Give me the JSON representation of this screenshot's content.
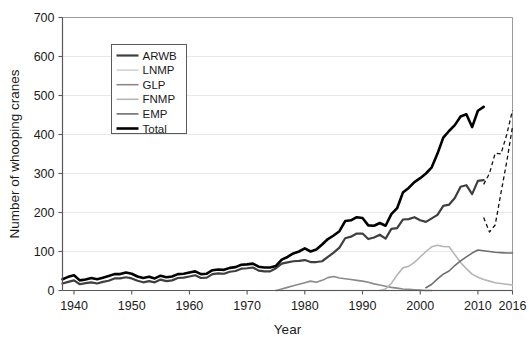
{
  "chart_data": {
    "type": "line",
    "title": "",
    "xlabel": "Year",
    "ylabel": "Number of whooping cranes",
    "xlim": [
      1938,
      2016
    ],
    "ylim": [
      0,
      700
    ],
    "xticks": [
      1940,
      1950,
      1960,
      1970,
      1980,
      1990,
      2000,
      2010,
      2016
    ],
    "yticks": [
      0,
      100,
      200,
      300,
      400,
      500,
      600,
      700
    ],
    "grid": "horizontal",
    "legend_position": "upper-left-inside",
    "legend_entries": [
      "ARWB",
      "LNMP",
      "GLP",
      "FNMP",
      "EMP",
      "Total"
    ],
    "colors": {
      "ARWB": "#3f3f3f",
      "LNMP": "#cfcfcf",
      "GLP": "#8a8a8a",
      "FNMP": "#b5b5b5",
      "EMP": "#6e6e6e",
      "Total": "#000000",
      "grid": "#e8e8e8",
      "frame": "#9a9a9a",
      "axis": "#595959"
    },
    "series": [
      {
        "name": "ARWB",
        "style": "solid",
        "x": [
          1938,
          1939,
          1940,
          1941,
          1942,
          1943,
          1944,
          1945,
          1946,
          1947,
          1948,
          1949,
          1950,
          1951,
          1952,
          1953,
          1954,
          1955,
          1956,
          1957,
          1958,
          1959,
          1960,
          1961,
          1962,
          1963,
          1964,
          1965,
          1966,
          1967,
          1968,
          1969,
          1970,
          1971,
          1972,
          1973,
          1974,
          1975,
          1976,
          1977,
          1978,
          1979,
          1980,
          1981,
          1982,
          1983,
          1984,
          1985,
          1986,
          1987,
          1988,
          1989,
          1990,
          1991,
          1992,
          1993,
          1994,
          1995,
          1996,
          1997,
          1998,
          1999,
          2000,
          2001,
          2002,
          2003,
          2004,
          2005,
          2006,
          2007,
          2008,
          2009,
          2010,
          2011,
          2012,
          2013,
          2014,
          2015,
          2016
        ],
        "values": [
          18,
          22,
          26,
          16,
          19,
          21,
          18,
          22,
          25,
          31,
          31,
          34,
          31,
          25,
          21,
          24,
          21,
          28,
          24,
          26,
          32,
          33,
          36,
          39,
          32,
          33,
          42,
          44,
          43,
          48,
          50,
          56,
          57,
          59,
          51,
          49,
          49,
          57,
          69,
          72,
          75,
          76,
          78,
          73,
          73,
          75,
          86,
          97,
          110,
          134,
          138,
          146,
          146,
          132,
          136,
          143,
          133,
          158,
          160,
          182,
          183,
          188,
          180,
          176,
          185,
          194,
          217,
          220,
          237,
          266,
          270,
          247,
          281,
          283,
          254,
          304,
          308,
          329,
          431
        ],
        "dashed_from": 2011
      },
      {
        "name": "LNMP",
        "style": "solid",
        "x": [
          1975,
          1980,
          1985,
          1990,
          1995,
          2000,
          2002,
          2005,
          2010,
          2016
        ],
        "values": [
          0,
          0,
          0,
          0,
          0,
          0,
          0,
          0,
          0,
          0
        ]
      },
      {
        "name": "GLP",
        "style": "solid",
        "x": [
          1975,
          1976,
          1977,
          1978,
          1979,
          1980,
          1981,
          1982,
          1983,
          1984,
          1985,
          1986,
          1987,
          1988,
          1989,
          1990,
          1991,
          1992,
          1993,
          1994,
          1995,
          1996,
          1997,
          1998,
          1999,
          2000,
          2001,
          2002
        ],
        "values": [
          0,
          4,
          8,
          12,
          16,
          20,
          24,
          21,
          26,
          33,
          36,
          32,
          30,
          28,
          26,
          24,
          21,
          17,
          14,
          11,
          8,
          6,
          4,
          3,
          2,
          1,
          0,
          0
        ]
      },
      {
        "name": "FNMP",
        "style": "solid",
        "x": [
          1993,
          1994,
          1995,
          1996,
          1997,
          1998,
          1999,
          2000,
          2001,
          2002,
          2003,
          2004,
          2005,
          2006,
          2007,
          2008,
          2009,
          2010,
          2011,
          2012,
          2013,
          2014,
          2015,
          2016
        ],
        "values": [
          0,
          4,
          18,
          40,
          58,
          62,
          72,
          86,
          100,
          112,
          116,
          113,
          112,
          92,
          72,
          56,
          42,
          34,
          28,
          24,
          20,
          18,
          16,
          14
        ]
      },
      {
        "name": "EMP",
        "style": "solid",
        "x": [
          2001,
          2002,
          2003,
          2004,
          2005,
          2006,
          2007,
          2008,
          2009,
          2010,
          2011,
          2012,
          2013,
          2014,
          2015,
          2016
        ],
        "values": [
          7,
          16,
          30,
          42,
          50,
          64,
          76,
          86,
          96,
          104,
          102,
          100,
          98,
          97,
          96,
          96
        ]
      },
      {
        "name": "Total",
        "style": "solid",
        "x": [
          1938,
          1939,
          1940,
          1941,
          1942,
          1943,
          1944,
          1945,
          1946,
          1947,
          1948,
          1949,
          1950,
          1951,
          1952,
          1953,
          1954,
          1955,
          1956,
          1957,
          1958,
          1959,
          1960,
          1961,
          1962,
          1963,
          1964,
          1965,
          1966,
          1967,
          1968,
          1969,
          1970,
          1971,
          1972,
          1973,
          1974,
          1975,
          1976,
          1977,
          1978,
          1979,
          1980,
          1981,
          1982,
          1983,
          1984,
          1985,
          1986,
          1987,
          1988,
          1989,
          1990,
          1991,
          1992,
          1993,
          1994,
          1995,
          1996,
          1997,
          1998,
          1999,
          2000,
          2001,
          2002,
          2003,
          2004,
          2005,
          2006,
          2007,
          2008,
          2009,
          2010,
          2011,
          2012,
          2013,
          2014,
          2015,
          2016
        ],
        "values": [
          29,
          35,
          39,
          26,
          28,
          32,
          29,
          33,
          37,
          42,
          42,
          46,
          43,
          36,
          32,
          35,
          31,
          38,
          34,
          36,
          42,
          43,
          46,
          49,
          42,
          43,
          52,
          54,
          53,
          58,
          60,
          66,
          67,
          69,
          61,
          59,
          59,
          63,
          79,
          86,
          95,
          100,
          108,
          100,
          105,
          118,
          132,
          141,
          152,
          178,
          180,
          188,
          186,
          167,
          166,
          173,
          166,
          196,
          211,
          251,
          263,
          278,
          288,
          300,
          316,
          351,
          392,
          409,
          424,
          446,
          452,
          419,
          461,
          471,
          442,
          501,
          506,
          540,
          605
        ],
        "dashed_from": 2011
      }
    ],
    "annotations": [
      {
        "note": "dashed segments after 2011 for ARWB and Total indicate projected/alternate estimates"
      }
    ]
  },
  "axis": {
    "x_title": "Year",
    "y_title": "Number of whooping cranes",
    "x_tick_labels": [
      "1940",
      "1950",
      "1960",
      "1970",
      "1980",
      "1990",
      "2000",
      "2010",
      "2016"
    ],
    "y_tick_labels": [
      "0",
      "100",
      "200",
      "300",
      "400",
      "500",
      "600",
      "700"
    ]
  },
  "legend": {
    "items": [
      {
        "label": "ARWB",
        "color": "#3f3f3f",
        "width": 2.2
      },
      {
        "label": "LNMP",
        "color": "#cfcfcf",
        "width": 1.5
      },
      {
        "label": "GLP",
        "color": "#8a8a8a",
        "width": 1.6
      },
      {
        "label": "FNMP",
        "color": "#b5b5b5",
        "width": 1.6
      },
      {
        "label": "EMP",
        "color": "#6e6e6e",
        "width": 1.6
      },
      {
        "label": "Total",
        "color": "#000000",
        "width": 2.6
      }
    ]
  }
}
